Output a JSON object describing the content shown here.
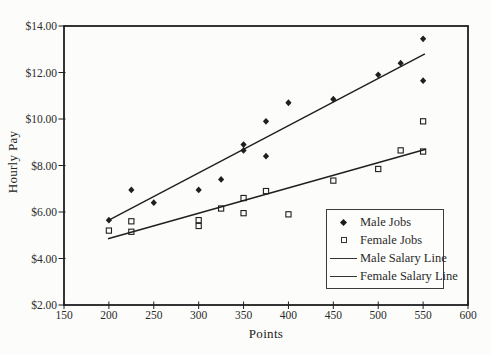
{
  "chart_data": {
    "type": "scatter",
    "title": "",
    "xlabel": "Points",
    "ylabel": "Hourly Pay",
    "xlim": [
      150,
      600
    ],
    "ylim": [
      2,
      14
    ],
    "grid": false,
    "x_ticks": [
      150,
      200,
      250,
      300,
      350,
      400,
      450,
      500,
      550,
      600
    ],
    "y_ticks": [
      {
        "value": 14,
        "label": "$14.00"
      },
      {
        "value": 12,
        "label": "$12.00"
      },
      {
        "value": 10,
        "label": "$10.00"
      },
      {
        "value": 8,
        "label": "$8.00"
      },
      {
        "value": 6,
        "label": "$6.00"
      },
      {
        "value": 4,
        "label": "$4.00"
      },
      {
        "value": 2,
        "label": "$2.00"
      }
    ],
    "series": [
      {
        "name": "Male Jobs",
        "marker": "filled-diamond",
        "points": [
          [
            200,
            5.65
          ],
          [
            225,
            6.95
          ],
          [
            250,
            6.4
          ],
          [
            300,
            6.95
          ],
          [
            325,
            7.4
          ],
          [
            350,
            8.9
          ],
          [
            350,
            8.65
          ],
          [
            375,
            9.9
          ],
          [
            375,
            8.4
          ],
          [
            400,
            10.7
          ],
          [
            450,
            10.85
          ],
          [
            500,
            11.9
          ],
          [
            525,
            12.4
          ],
          [
            550,
            13.45
          ],
          [
            550,
            11.65
          ]
        ]
      },
      {
        "name": "Female Jobs",
        "marker": "open-square",
        "points": [
          [
            200,
            5.2
          ],
          [
            225,
            5.6
          ],
          [
            225,
            5.15
          ],
          [
            300,
            5.65
          ],
          [
            300,
            5.4
          ],
          [
            325,
            6.15
          ],
          [
            350,
            6.6
          ],
          [
            350,
            5.95
          ],
          [
            375,
            6.9
          ],
          [
            400,
            5.9
          ],
          [
            450,
            7.35
          ],
          [
            500,
            7.85
          ],
          [
            525,
            8.65
          ],
          [
            550,
            9.9
          ],
          [
            550,
            8.6
          ]
        ]
      }
    ],
    "trend_lines": [
      {
        "name": "Male Salary Line",
        "from": [
          200,
          5.65
        ],
        "to": [
          552,
          12.8
        ]
      },
      {
        "name": "Female Salary Line",
        "from": [
          199,
          4.85
        ],
        "to": [
          553,
          8.7
        ]
      }
    ],
    "legend": {
      "position": "inside-bottom-right",
      "items": [
        "Male Jobs",
        "Female Jobs",
        "Male Salary Line",
        "Female Salary Line"
      ]
    }
  },
  "colors": {
    "ink": "#1f1f1f",
    "text": "#2b2b2b",
    "background": "#fcfcfa",
    "legend_border": "#3c3c3c"
  }
}
